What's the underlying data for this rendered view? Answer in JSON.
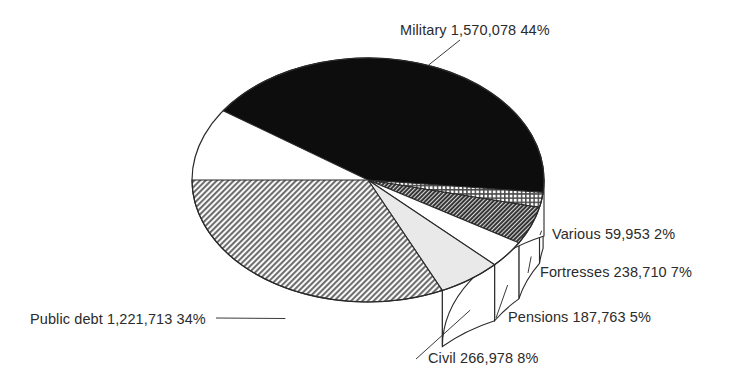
{
  "chart_data": {
    "type": "pie",
    "title": "",
    "subtitle": "",
    "xlabel": "",
    "ylabel": "",
    "style": "3d-pie",
    "legend_position": "outside-labels",
    "grid": false,
    "total": 3545195,
    "categories": [
      "Military",
      "Various",
      "Fortresses",
      "Pensions",
      "Civil",
      "Public debt"
    ],
    "values": [
      1570078,
      59953,
      238710,
      187763,
      266978,
      1221713
    ],
    "percents": [
      44,
      2,
      7,
      5,
      8,
      34
    ],
    "slices": [
      {
        "name": "Military",
        "label": "Military 1,570,078 44%",
        "value": 1570078,
        "value_text": "1,570,078",
        "percent": 44,
        "percent_text": "44%",
        "fill": "solid-black",
        "color": "#0d0d0d",
        "start_angle": -13,
        "end_angle": 145.4,
        "label_x": 400,
        "label_y": 35,
        "label_anchor": "start"
      },
      {
        "name": "Various",
        "label": "Various 59,953 2%",
        "value": 59953,
        "value_text": "59,953",
        "percent": 2,
        "percent_text": "2%",
        "fill": "grid-hatch",
        "color": "#8f8f8f",
        "start_angle": -13,
        "end_angle": -5.8,
        "label_x": 552,
        "label_y": 239,
        "label_anchor": "start"
      },
      {
        "name": "Fortresses",
        "label": "Fortresses 238,710 7%",
        "value": 238710,
        "value_text": "238,710",
        "percent": 7,
        "percent_text": "7%",
        "fill": "dark-diagonal-hatch",
        "color": "#484848",
        "start_angle": -31,
        "end_angle": -13,
        "label_x": 540,
        "label_y": 277,
        "label_anchor": "start"
      },
      {
        "name": "Pensions",
        "label": "Pensions 187,763 5%",
        "value": 187763,
        "value_text": "187,763",
        "percent": 5,
        "percent_text": "5%",
        "fill": "white",
        "color": "#ffffff",
        "start_angle": -44,
        "end_angle": -31,
        "label_x": 508,
        "label_y": 322,
        "label_anchor": "start"
      },
      {
        "name": "Civil",
        "label": "Civil 266,978 8%",
        "value": 266978,
        "value_text": "266,978",
        "percent": 8,
        "percent_text": "8%",
        "fill": "light-gray",
        "color": "#e6e6e6",
        "start_angle": -65,
        "end_angle": -44,
        "label_x": 428,
        "label_y": 363,
        "label_anchor": "start"
      },
      {
        "name": "Public debt",
        "label": "Public debt 1,221,713 34%",
        "value": 1221713,
        "value_text": "1,221,713",
        "percent": 34,
        "percent_text": "34%",
        "fill": "medium-diagonal-hatch",
        "color": "#9a9a9a",
        "start_angle": -180,
        "end_angle": -65,
        "label_x": 30,
        "label_y": 324,
        "label_anchor": "start"
      }
    ]
  },
  "geometry": {
    "cx": 368,
    "cy": 180,
    "rx": 176,
    "ry": 122,
    "depth": 56
  }
}
